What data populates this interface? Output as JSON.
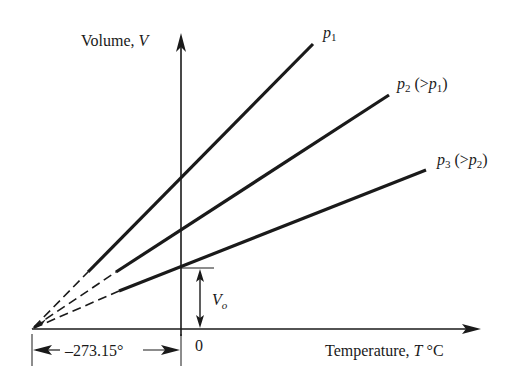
{
  "diagram": {
    "y_axis_label": {
      "text": "Volume, ",
      "var": "V"
    },
    "x_axis_label": {
      "text": "Temperature, ",
      "var": "T",
      "unit": " °C"
    },
    "x_origin_label": "0",
    "absolute_zero_label": "–273.15°",
    "intercept_label": {
      "var": "V",
      "sub": "o"
    },
    "lines": [
      {
        "name": "p1",
        "label_var": "p",
        "label_sub": "1",
        "label_rest": "",
        "label_rest_var": "",
        "label_rest_sub": ""
      },
      {
        "name": "p2",
        "label_var": "p",
        "label_sub": "2",
        "label_rest": " (>",
        "label_rest_var": "p",
        "label_rest_sub": "1",
        "label_close": ")"
      },
      {
        "name": "p3",
        "label_var": "p",
        "label_sub": "3",
        "label_rest": " (>",
        "label_rest_var": "p",
        "label_rest_sub": "2",
        "label_close": ")"
      }
    ],
    "colors": {
      "ink": "#1a1a1a",
      "background": "#ffffff"
    }
  }
}
